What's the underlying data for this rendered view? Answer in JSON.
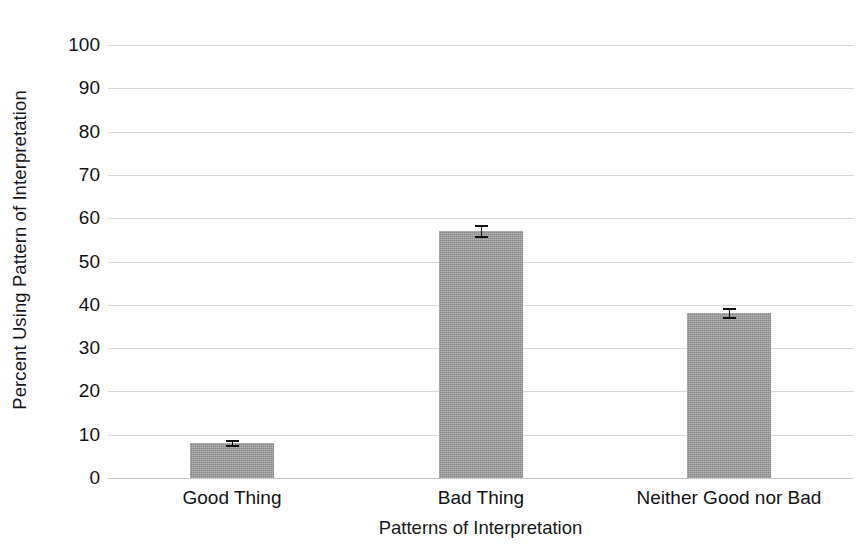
{
  "chart_data": {
    "type": "bar",
    "title": "",
    "xlabel": "Patterns of Interpretation",
    "ylabel": "Percent Using Pattern of Interpretation",
    "categories": [
      "Good Thing",
      "Bad Thing",
      "Neither Good nor Bad"
    ],
    "values": [
      8,
      57,
      38
    ],
    "errors": [
      0.8,
      1.5,
      1.3
    ],
    "ylim": [
      0,
      100
    ],
    "yticks": [
      0,
      10,
      20,
      30,
      40,
      50,
      60,
      70,
      80,
      90,
      100
    ],
    "ytick_labels": [
      "0",
      "10",
      "20",
      "30",
      "40",
      "50",
      "60",
      "70",
      "80",
      "90",
      "100"
    ],
    "grid": true,
    "legend": false,
    "legend_position": "none",
    "bar_color": "#9b9b9b",
    "error_bar_color": "#111111",
    "gridline_color": "#cfcfcf",
    "axis_text_color": "#121214"
  }
}
